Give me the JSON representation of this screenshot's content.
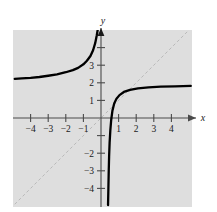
{
  "figure": {
    "background_color": "#ffffff",
    "plot_background_color": "#dedede",
    "curve_color": "#000000",
    "axis_color": "#4a4a4a",
    "asymptote_line_color": "#b9b9b9",
    "plot_area": {
      "x": 13,
      "y": 30,
      "width": 179,
      "height": 177
    }
  },
  "chart_data": {
    "type": "line",
    "title": "",
    "xlabel": "x",
    "ylabel": "y",
    "xlim": [
      -4.9,
      5.1
    ],
    "ylim": [
      -4.9,
      5.0
    ],
    "grid": false,
    "legend": null,
    "origin_px": {
      "x": 101,
      "y": 118
    },
    "px_per_unit": {
      "x": 17.6,
      "y": 17.6
    },
    "xticks": [
      -4,
      -3,
      -2,
      -1,
      1,
      2,
      3,
      4
    ],
    "xtick_labels": [
      "-4",
      "-3",
      "-2",
      "-1",
      "1",
      "2",
      "3",
      "4"
    ],
    "yticks": [
      -4,
      -3,
      -2,
      -1,
      1,
      2,
      3,
      4
    ],
    "ytick_labels": [
      "-4",
      "-3",
      "-2",
      "",
      "",
      "1",
      "2",
      "3",
      ""
    ],
    "ytick_labels_shown": [
      "3",
      "2",
      "1",
      "-2",
      "-3",
      "-4"
    ],
    "asymptotes": {
      "vertical": 0.45,
      "horizontal": 2.0
    },
    "series": [
      {
        "name": "left-branch",
        "comment": "Upper-left branch: approaches y=2 from above as x decreases, rises steeply toward +infinity near x=0.",
        "points": [
          [
            -4.9,
            2.22
          ],
          [
            -4.5,
            2.25
          ],
          [
            -4.0,
            2.28
          ],
          [
            -3.5,
            2.33
          ],
          [
            -3.0,
            2.4
          ],
          [
            -2.5,
            2.48
          ],
          [
            -2.0,
            2.6
          ],
          [
            -1.6,
            2.72
          ],
          [
            -1.3,
            2.85
          ],
          [
            -1.0,
            3.05
          ],
          [
            -0.8,
            3.25
          ],
          [
            -0.6,
            3.52
          ],
          [
            -0.45,
            3.85
          ],
          [
            -0.33,
            4.25
          ],
          [
            -0.24,
            4.7
          ],
          [
            -0.18,
            5.05
          ]
        ]
      },
      {
        "name": "right-branch",
        "comment": "Lower-right branch: rises from -infinity at x~0.45 and approaches y=2 from below as x increases.",
        "points": [
          [
            0.4,
            -4.95
          ],
          [
            0.42,
            -4.0
          ],
          [
            0.44,
            -3.0
          ],
          [
            0.46,
            -2.2
          ],
          [
            0.49,
            -1.4
          ],
          [
            0.53,
            -0.7
          ],
          [
            0.58,
            -0.1
          ],
          [
            0.65,
            0.42
          ],
          [
            0.75,
            0.82
          ],
          [
            0.88,
            1.1
          ],
          [
            1.05,
            1.3
          ],
          [
            1.3,
            1.48
          ],
          [
            1.65,
            1.6
          ],
          [
            2.1,
            1.68
          ],
          [
            2.7,
            1.74
          ],
          [
            3.4,
            1.78
          ],
          [
            4.2,
            1.8
          ],
          [
            5.1,
            1.82
          ]
        ]
      },
      {
        "name": "identity-line",
        "comment": "Dashed reference line y = x",
        "style": "dashed",
        "points": [
          [
            -4.9,
            -4.9
          ],
          [
            5.1,
            5.1
          ]
        ]
      }
    ]
  }
}
